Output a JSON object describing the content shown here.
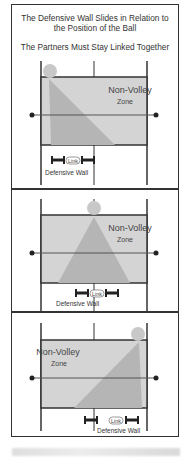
{
  "header": {
    "title_line1": "The Defensive Wall Slides in Relation to",
    "title_line2": "the Position of the Ball",
    "subtitle": "The Partners Must Stay Linked Together"
  },
  "panels": [
    {
      "zone_label_1": "Non-Volley",
      "zone_label_2": "Zone",
      "link_label": "Link",
      "wall_label": "Defensive Wall",
      "ball_position": "left"
    },
    {
      "zone_label_1": "Non-Volley",
      "zone_label_2": "Zone",
      "link_label": "Link",
      "wall_label": "Defensive Wall",
      "ball_position": "center"
    },
    {
      "zone_label_1": "Non-Volley",
      "zone_label_2": "Zone",
      "link_label": "Link",
      "wall_label": "Defensive Wall",
      "ball_position": "right"
    }
  ],
  "colors": {
    "zone_fill": "#d4d4d4",
    "triangle_fill": "#b5b5b5",
    "ball_fill": "#c8c8c8",
    "line": "#333333"
  }
}
